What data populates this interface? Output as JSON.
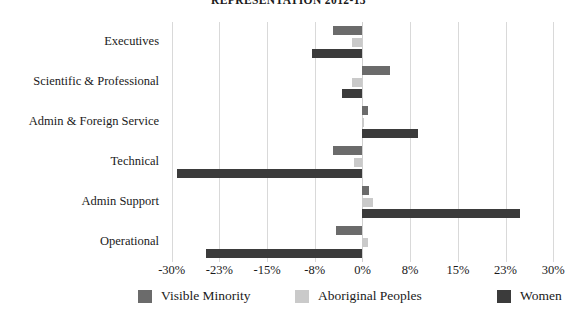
{
  "chart_data": {
    "type": "bar",
    "orientation": "horizontal",
    "title": "REPRESENTATION 2012-13",
    "xlabel": "",
    "ylabel": "",
    "categories": [
      "Executives",
      "Scientific & Professional",
      "Admin & Foreign Service",
      "Technical",
      "Admin Support",
      "Operational"
    ],
    "series": [
      {
        "name": "Visible Minority",
        "color": "#6b6b6b",
        "values": [
          -4.7,
          4.3,
          0.8,
          -4.6,
          1.0,
          -4.1
        ]
      },
      {
        "name": "Aboriginal Peoples",
        "color": "#cacaca",
        "values": [
          -1.6,
          -1.6,
          0.2,
          -1.4,
          1.6,
          0.8
        ]
      },
      {
        "name": "Women",
        "color": "#3b3b3b",
        "values": [
          -8.0,
          -3.2,
          8.7,
          -29.2,
          24.8,
          -24.6
        ]
      }
    ],
    "xticks": [
      "-30%",
      "-23%",
      "-15%",
      "-8%",
      "0%",
      "8%",
      "15%",
      "23%",
      "30%"
    ],
    "xtick_values": [
      -30,
      -22.5,
      -15,
      -7.5,
      0,
      7.5,
      15,
      22.5,
      30
    ],
    "xlim": [
      -30,
      30
    ],
    "grid": true,
    "legend_position": "bottom"
  }
}
